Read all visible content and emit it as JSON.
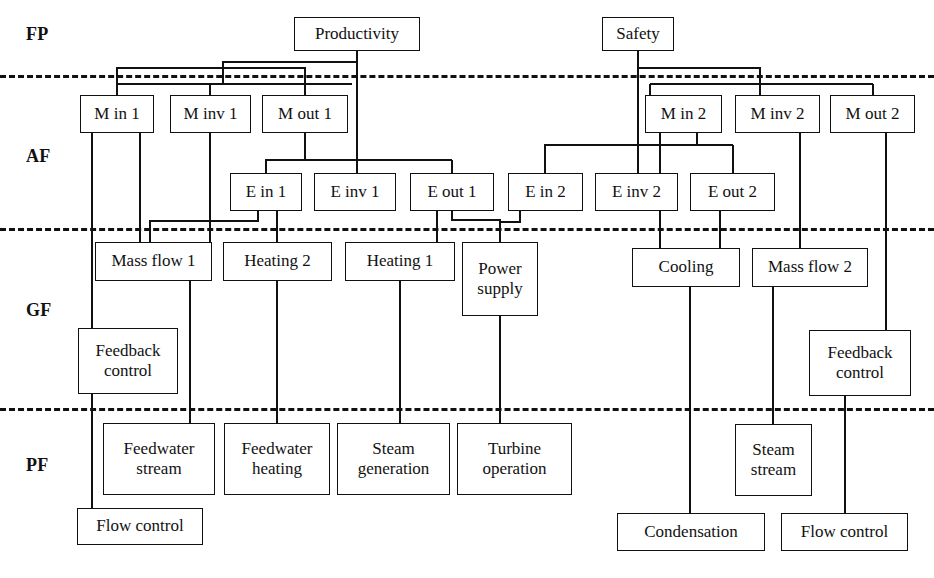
{
  "diagram": {
    "tiers": [
      {
        "id": "fp",
        "label": "FP",
        "x": 26,
        "y": 24
      },
      {
        "id": "af",
        "label": "AF",
        "x": 26,
        "y": 146
      },
      {
        "id": "gf",
        "label": "GF",
        "x": 26,
        "y": 300
      },
      {
        "id": "pf",
        "label": "PF",
        "x": 26,
        "y": 455
      }
    ],
    "separators": [
      {
        "id": "fp-af",
        "y": 75
      },
      {
        "id": "af-gf",
        "y": 228
      },
      {
        "id": "gf-pf",
        "y": 408
      }
    ],
    "nodes": [
      {
        "id": "productivity",
        "label": "Productivity",
        "x": 294,
        "y": 17,
        "w": 126,
        "h": 34
      },
      {
        "id": "safety",
        "label": "Safety",
        "x": 602,
        "y": 17,
        "w": 72,
        "h": 34
      },
      {
        "id": "m-in-1",
        "label": "M in 1",
        "x": 80,
        "y": 95,
        "w": 74,
        "h": 38
      },
      {
        "id": "m-inv-1",
        "label": "M inv 1",
        "x": 170,
        "y": 95,
        "w": 81,
        "h": 38
      },
      {
        "id": "m-out-1",
        "label": "M out 1",
        "x": 262,
        "y": 95,
        "w": 86,
        "h": 38
      },
      {
        "id": "m-in-2",
        "label": "M in 2",
        "x": 645,
        "y": 95,
        "w": 77,
        "h": 38
      },
      {
        "id": "m-inv-2",
        "label": "M inv 2",
        "x": 735,
        "y": 95,
        "w": 85,
        "h": 38
      },
      {
        "id": "m-out-2",
        "label": "M out 2",
        "x": 830,
        "y": 95,
        "w": 85,
        "h": 38
      },
      {
        "id": "e-in-1",
        "label": "E in 1",
        "x": 230,
        "y": 173,
        "w": 72,
        "h": 38
      },
      {
        "id": "e-inv-1",
        "label": "E inv 1",
        "x": 314,
        "y": 173,
        "w": 82,
        "h": 38
      },
      {
        "id": "e-out-1",
        "label": "E out 1",
        "x": 410,
        "y": 173,
        "w": 84,
        "h": 38
      },
      {
        "id": "e-in-2",
        "label": "E in 2",
        "x": 508,
        "y": 173,
        "w": 75,
        "h": 38
      },
      {
        "id": "e-inv-2",
        "label": "E inv 2",
        "x": 595,
        "y": 173,
        "w": 83,
        "h": 38
      },
      {
        "id": "e-out-2",
        "label": "E out 2",
        "x": 690,
        "y": 173,
        "w": 85,
        "h": 38
      },
      {
        "id": "mass-flow-1",
        "label": "Mass flow 1",
        "x": 95,
        "y": 242,
        "w": 117,
        "h": 39
      },
      {
        "id": "heating-2",
        "label": "Heating 2",
        "x": 223,
        "y": 242,
        "w": 109,
        "h": 39
      },
      {
        "id": "heating-1",
        "label": "Heating 1",
        "x": 345,
        "y": 242,
        "w": 110,
        "h": 39
      },
      {
        "id": "power-supply",
        "label": "Power\nsupply",
        "x": 462,
        "y": 242,
        "w": 76,
        "h": 74
      },
      {
        "id": "cooling",
        "label": "Cooling",
        "x": 632,
        "y": 248,
        "w": 108,
        "h": 39
      },
      {
        "id": "mass-flow-2",
        "label": "Mass flow 2",
        "x": 752,
        "y": 248,
        "w": 116,
        "h": 39
      },
      {
        "id": "feedback-control-1",
        "label": "Feedback\ncontrol",
        "x": 78,
        "y": 328,
        "w": 100,
        "h": 66
      },
      {
        "id": "feedback-control-2",
        "label": "Feedback\ncontrol",
        "x": 809,
        "y": 330,
        "w": 102,
        "h": 66
      },
      {
        "id": "feedwater-stream",
        "label": "Feedwater\nstream",
        "x": 103,
        "y": 423,
        "w": 112,
        "h": 72
      },
      {
        "id": "feedwater-heating",
        "label": "Feedwater\nheating",
        "x": 224,
        "y": 423,
        "w": 106,
        "h": 72
      },
      {
        "id": "steam-generation",
        "label": "Steam\ngeneration",
        "x": 337,
        "y": 423,
        "w": 113,
        "h": 72
      },
      {
        "id": "turbine-operation",
        "label": "Turbine\noperation",
        "x": 457,
        "y": 423,
        "w": 115,
        "h": 72
      },
      {
        "id": "steam-stream",
        "label": "Steam\nstream",
        "x": 735,
        "y": 424,
        "w": 77,
        "h": 72
      },
      {
        "id": "flow-control-1",
        "label": "Flow control",
        "x": 77,
        "y": 508,
        "w": 126,
        "h": 37
      },
      {
        "id": "condensation",
        "label": "Condensation",
        "x": 617,
        "y": 513,
        "w": 148,
        "h": 38
      },
      {
        "id": "flow-control-2",
        "label": "Flow control",
        "x": 781,
        "y": 513,
        "w": 127,
        "h": 38
      }
    ],
    "connector_color": "#111111"
  }
}
